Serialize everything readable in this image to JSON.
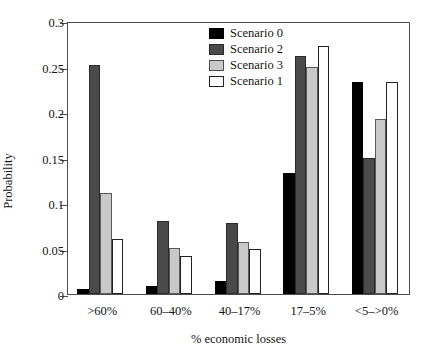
{
  "chart_data": {
    "type": "bar",
    "title": "",
    "xlabel": "% economic losses",
    "ylabel": "Probability",
    "categories": [
      ">60%",
      "60–40%",
      "40–17%",
      "17–5%",
      "<5–>0%"
    ],
    "ylim": [
      0,
      0.3
    ],
    "yticks": [
      0,
      0.05,
      0.1,
      0.15,
      0.2,
      0.25,
      0.3
    ],
    "ytick_labels": [
      "0",
      "0.05",
      "0.1",
      "0.15",
      "0.2",
      "0.25",
      "0.3"
    ],
    "grid": false,
    "legend_position": "top-center",
    "series": [
      {
        "name": "Scenario 0",
        "color": "#000000",
        "values": [
          0.006,
          0.009,
          0.014,
          0.133,
          0.233
        ]
      },
      {
        "name": "Scenario 2",
        "color": "#4a4a4a",
        "values": [
          0.252,
          0.08,
          0.078,
          0.262,
          0.15
        ]
      },
      {
        "name": "Scenario 3",
        "color": "#c9c9c9",
        "values": [
          0.111,
          0.051,
          0.057,
          0.25,
          0.192
        ]
      },
      {
        "name": "Scenario 1",
        "color": "#ffffff",
        "values": [
          0.061,
          0.042,
          0.05,
          0.272,
          0.233
        ]
      }
    ]
  }
}
